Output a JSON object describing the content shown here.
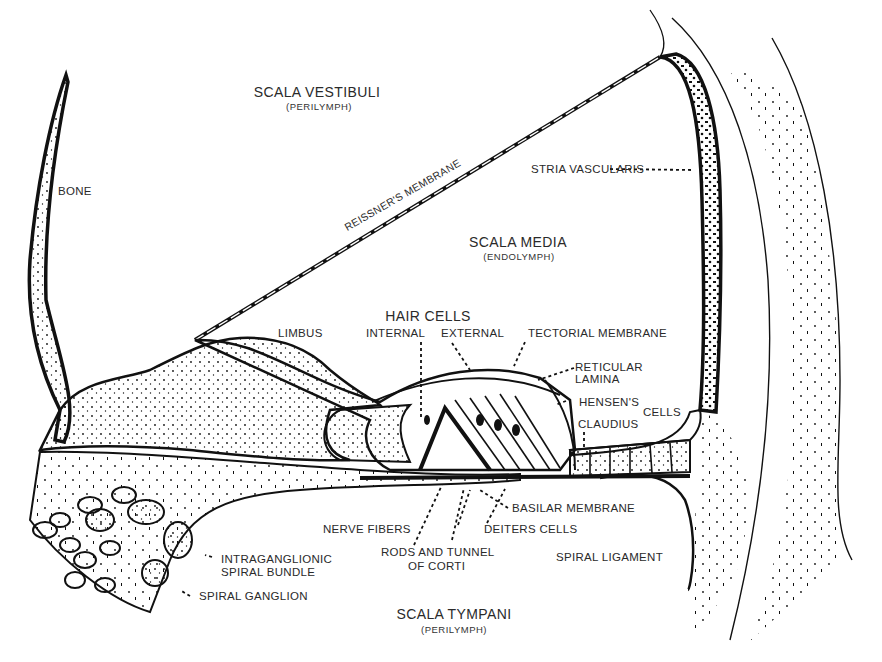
{
  "chambers": {
    "scala_vestibuli": {
      "label": "SCALA VESTIBULI",
      "fluid": "(PERILYMPH)"
    },
    "scala_media": {
      "label": "SCALA MEDIA",
      "fluid": "(ENDOLYMPH)"
    },
    "scala_tympani": {
      "label": "SCALA TYMPANI",
      "fluid": "(PERILYMPH)"
    }
  },
  "labels": {
    "bone": "BONE",
    "reissners_membrane": "REISSNER'S MEMBRANE",
    "stria_vascularis": "STRIA VASCULARIS",
    "hair_cells": "HAIR CELLS",
    "internal": "INTERNAL",
    "external": "EXTERNAL",
    "limbus": "LIMBUS",
    "tectorial_membrane": "TECTORIAL MEMBRANE",
    "reticular_lamina_1": "RETICULAR",
    "reticular_lamina_2": "LAMINA",
    "hensens": "HENSEN'S",
    "cells": "CELLS",
    "claudius": "CLAUDIUS",
    "basilar_membrane": "BASILAR MEMBRANE",
    "deiters_cells": "DEITERS CELLS",
    "nerve_fibers": "NERVE FIBERS",
    "rods_tunnel_1": "RODS AND TUNNEL",
    "rods_tunnel_2": "OF CORTI",
    "spiral_ligament": "SPIRAL LIGAMENT",
    "intraganglionic_1": "INTRAGANGLIONIC",
    "intraganglionic_2": "SPIRAL BUNDLE",
    "spiral_ganglion": "SPIRAL GANGLION"
  },
  "colors": {
    "ink": "#111111",
    "label": "#2a2a2a",
    "background": "#ffffff"
  }
}
